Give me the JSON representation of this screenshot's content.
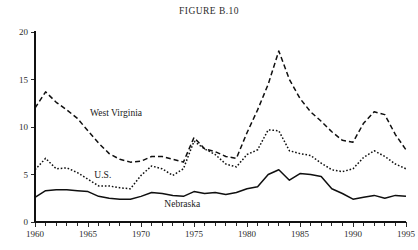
{
  "figure": {
    "title": "FIGURE B.10"
  },
  "labels": {
    "west_virginia": "West Virginia",
    "us": "U.S.",
    "nebraska": "Nebraska"
  },
  "chart_data": {
    "type": "line",
    "title": "FIGURE B.10",
    "xlabel": "",
    "ylabel": "",
    "xlim": [
      1960,
      1995
    ],
    "ylim": [
      0,
      20
    ],
    "yticks": [
      0,
      5,
      10,
      15,
      20
    ],
    "ytick_labels": [
      "0",
      "5",
      "10",
      "15",
      "20"
    ],
    "xticks": [
      1960,
      1965,
      1970,
      1975,
      1980,
      1985,
      1990,
      1995
    ],
    "xtick_labels": [
      "1960",
      "1965",
      "1970",
      "1975",
      "1980",
      "1985",
      "1990",
      "1995"
    ],
    "x_minor_tick_step": 1,
    "grid": false,
    "legend": "inline-annotations",
    "x": [
      1960,
      1961,
      1962,
      1963,
      1964,
      1965,
      1966,
      1967,
      1968,
      1969,
      1970,
      1971,
      1972,
      1973,
      1974,
      1975,
      1976,
      1977,
      1978,
      1979,
      1980,
      1981,
      1982,
      1983,
      1984,
      1985,
      1986,
      1987,
      1988,
      1989,
      1990,
      1991,
      1992,
      1993,
      1994,
      1995
    ],
    "series": [
      {
        "name": "West Virginia",
        "style": "dashed",
        "label_x": 1965.2,
        "label_y": 11.2,
        "values": [
          12.0,
          13.7,
          12.6,
          11.8,
          10.9,
          9.6,
          8.3,
          7.2,
          6.6,
          6.3,
          6.4,
          6.9,
          6.9,
          6.6,
          6.3,
          8.9,
          7.7,
          7.4,
          6.9,
          6.7,
          9.4,
          11.8,
          14.5,
          18.0,
          15.0,
          13.0,
          11.6,
          10.6,
          9.5,
          8.6,
          8.4,
          10.4,
          11.6,
          11.3,
          9.2,
          7.6
        ]
      },
      {
        "name": "U.S.",
        "style": "dotted",
        "label_x": 1965.6,
        "label_y": 4.6,
        "values": [
          5.5,
          6.7,
          5.6,
          5.7,
          5.2,
          4.5,
          3.8,
          3.8,
          3.6,
          3.5,
          4.9,
          5.9,
          5.6,
          4.9,
          5.6,
          8.5,
          7.7,
          7.1,
          6.1,
          5.8,
          7.1,
          7.6,
          9.7,
          9.6,
          7.5,
          7.2,
          7.0,
          6.2,
          5.5,
          5.3,
          5.6,
          6.8,
          7.5,
          6.9,
          6.1,
          5.6
        ]
      },
      {
        "name": "Nebraska",
        "style": "solid",
        "label_x": 1972.2,
        "label_y": 1.6,
        "values": [
          2.6,
          3.3,
          3.4,
          3.4,
          3.3,
          3.2,
          2.7,
          2.5,
          2.4,
          2.4,
          2.7,
          3.1,
          3.0,
          2.8,
          2.7,
          3.2,
          3.0,
          3.1,
          2.9,
          3.1,
          3.5,
          3.7,
          5.0,
          5.5,
          4.4,
          5.1,
          5.0,
          4.8,
          3.5,
          3.0,
          2.4,
          2.6,
          2.8,
          2.5,
          2.8,
          2.7
        ]
      }
    ]
  }
}
